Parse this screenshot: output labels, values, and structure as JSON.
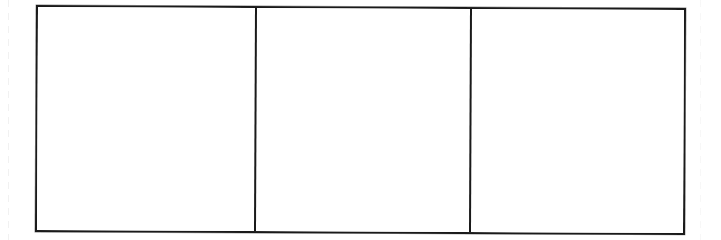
{
  "page": {
    "kind": "scanned-document",
    "width": 721,
    "height": 240,
    "background_color": "#ffffff",
    "ink_color": "#1a1a1a"
  },
  "table": {
    "rows": 1,
    "columns": 3,
    "border_color": "#1a1a1a",
    "border_width_px": 2,
    "cells": [
      {
        "id": "cell-1",
        "column": 1,
        "text": ""
      },
      {
        "id": "cell-2",
        "column": 2,
        "text": ""
      },
      {
        "id": "cell-3",
        "column": 3,
        "text": ""
      }
    ]
  },
  "artifacts": {
    "left_edge_label": "",
    "right_edge_label": ""
  }
}
